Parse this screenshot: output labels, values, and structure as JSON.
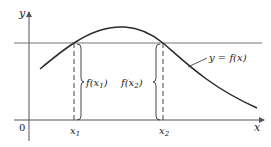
{
  "figure": {
    "type": "function-graph",
    "axes": {
      "x_label": "x",
      "y_label": "y",
      "origin_label": "0"
    },
    "curve": {
      "label": "y = f(x)",
      "shape": "rises to a single maximum then decreases"
    },
    "horizontal_line": {
      "description": "horizontal line intersecting the curve at two points of equal height"
    },
    "points": [
      {
        "x_label": "x₁",
        "x_sub_base": "x",
        "x_sub": "1",
        "value_label": "f(x₁)",
        "value_prefix": "f(x",
        "value_sub": "1",
        "value_suffix": ")"
      },
      {
        "x_label": "x₂",
        "x_sub_base": "x",
        "x_sub": "2",
        "value_label": "f(x₂)",
        "value_prefix": "f(x",
        "value_sub": "2",
        "value_suffix": ")"
      }
    ],
    "colors": {
      "stroke": "#2a2a2a",
      "axis": "#555555",
      "background": "#ffffff"
    }
  }
}
